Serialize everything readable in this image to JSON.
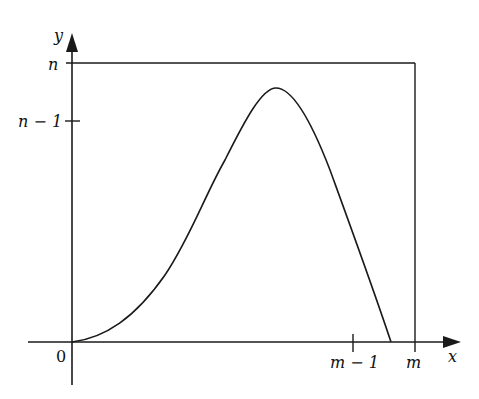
{
  "diagram": {
    "axes": {
      "x_label": "x",
      "y_label": "y",
      "origin_label": "0"
    },
    "y_ticks": [
      {
        "label": "n",
        "position": "top"
      },
      {
        "label": "n − 1",
        "position": "below top"
      }
    ],
    "x_ticks": [
      {
        "label": "m − 1"
      },
      {
        "label": "m"
      }
    ],
    "curve": {
      "description": "Smooth unimodal curve starting at origin, rising to a peak just below n, falling to the x-axis between m − 1 and m"
    },
    "colors": {
      "stroke": "#1a1a1a",
      "background": "#ffffff"
    }
  }
}
